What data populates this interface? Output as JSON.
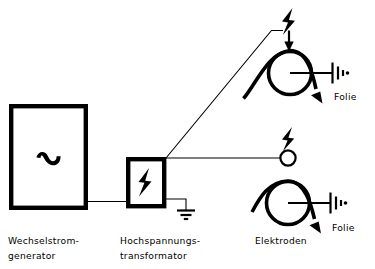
{
  "diagram": {
    "background_color": "#ffffff",
    "ink_color": "#000000",
    "width": 375,
    "height": 269
  },
  "labels": {
    "generator": "Wechselstrom-\ngenerator",
    "generator_line1": "Wechselstrom-",
    "generator_line2": "generator",
    "transformer_line1": "Hochspannungs-",
    "transformer_line2": "transformator",
    "electrodes": "Elektroden",
    "film_top": "Folie",
    "film_bottom": "Folie"
  },
  "components": {
    "generator": {
      "name": "Wechselstromgenerator",
      "symbol": "sine-wave",
      "box": {
        "x": 9,
        "y": 104,
        "width": 79,
        "height": 106
      }
    },
    "transformer": {
      "name": "Hochspannungstransformator",
      "symbol": "lightning-bolt",
      "box": {
        "x": 126,
        "y": 157,
        "width": 40,
        "height": 51
      }
    },
    "ground_transformer": {
      "name": "Erdung",
      "symbol": "earth-ground",
      "x": 186,
      "y": 210
    },
    "roller_top": {
      "name": "Walze oben",
      "cx": 290,
      "cy": 73,
      "r": 22
    },
    "roller_bottom": {
      "name": "Walze unten",
      "cx": 288,
      "cy": 203,
      "r": 22
    },
    "electrode_top": {
      "name": "Elektrode oben",
      "symbol": "bar-electrode-arrow",
      "x": 289,
      "y": 42
    },
    "electrode_bottom": {
      "name": "Elektrode unten",
      "symbol": "circle-electrode",
      "cx": 288,
      "cy": 158,
      "r": 8
    },
    "spark_top": {
      "name": "Funke oben",
      "symbol": "lightning-bolt",
      "x": 288,
      "y": 20
    },
    "spark_bottom": {
      "name": "Funke unten",
      "symbol": "lightning-bolt",
      "x": 288,
      "y": 138
    },
    "ground_roller_top": {
      "name": "Erdung Walze oben",
      "symbol": "earth-ground-rotated",
      "x": 338,
      "y": 73
    },
    "ground_roller_bottom": {
      "name": "Erdung Walze unten",
      "symbol": "earth-ground-rotated",
      "x": 336,
      "y": 203
    }
  },
  "wires": {
    "generator_to_transformer": "horizontal",
    "transformer_to_top_electrode": "diagonal",
    "transformer_to_bottom_electrode": "horizontal",
    "transformer_to_ground": "right-angle"
  },
  "film_paths": {
    "top": "wraps over roller, exits lower right with arrow",
    "bottom": "wraps over roller, exits lower right with arrow"
  }
}
